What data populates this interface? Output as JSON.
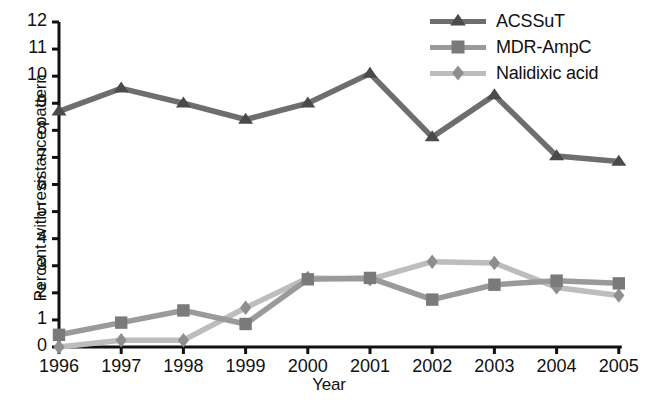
{
  "chart_data": {
    "type": "line",
    "title": "",
    "xlabel": "Year",
    "ylabel": "Percent with resistance pattern",
    "categories": [
      "1996",
      "1997",
      "1998",
      "1999",
      "2000",
      "2001",
      "2002",
      "2003",
      "2004",
      "2005"
    ],
    "x": [
      1996,
      1997,
      1998,
      1999,
      2000,
      2001,
      2002,
      2003,
      2004,
      2005
    ],
    "xlim": [
      1996,
      2005
    ],
    "ylim": [
      0,
      12
    ],
    "yticks": [
      0,
      1,
      2,
      3,
      4,
      5,
      6,
      7,
      8,
      9,
      10,
      11,
      12
    ],
    "ytick_labels": [
      "0",
      "1",
      "2",
      "3",
      "4",
      "5",
      "6",
      "7",
      "8",
      "9",
      "10",
      "11",
      "12"
    ],
    "grid": false,
    "legend_position": "top-right",
    "series": [
      {
        "name": "ACSSuT",
        "marker": "triangle",
        "color": "#6e6e6e",
        "marker_color": "#4a4a4a",
        "values": [
          8.7,
          9.55,
          9.0,
          8.4,
          9.0,
          10.1,
          7.75,
          9.3,
          7.05,
          6.85
        ]
      },
      {
        "name": "MDR-AmpC",
        "marker": "square",
        "color": "#9a9a9a",
        "marker_color": "#7a7a7a",
        "values": [
          0.45,
          0.9,
          1.35,
          0.85,
          2.5,
          2.55,
          1.75,
          2.3,
          2.45,
          2.35
        ]
      },
      {
        "name": "Nalidixic acid",
        "marker": "diamond",
        "color": "#bdbdbd",
        "marker_color": "#8e8e8e",
        "values": [
          0.0,
          0.25,
          0.25,
          1.45,
          2.55,
          2.5,
          3.15,
          3.1,
          2.2,
          1.9
        ]
      }
    ]
  },
  "legend": {
    "entries": [
      {
        "label": "ACSSuT"
      },
      {
        "label": "MDR-AmpC"
      },
      {
        "label": "Nalidixic acid"
      }
    ]
  },
  "axes": {
    "y_title": "Percent with resistance pattern",
    "x_title": "Year"
  },
  "colors": {
    "axis": "#111111",
    "background": "#ffffff",
    "series_acssut": "#6e6e6e",
    "series_mdr_ampc": "#9a9a9a",
    "series_nalidixic": "#bdbdbd"
  }
}
